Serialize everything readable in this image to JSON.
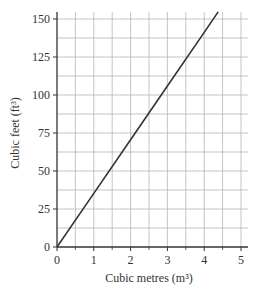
{
  "chart_data": {
    "type": "line",
    "title": "",
    "xlabel": "Cubic metres (m³)",
    "ylabel": "Cubic feet (ft³)",
    "xlim": [
      0,
      5
    ],
    "ylim": [
      0,
      150
    ],
    "x_ticks": [
      0,
      1,
      2,
      3,
      4,
      5
    ],
    "y_ticks": [
      0,
      25,
      50,
      75,
      100,
      125,
      150
    ],
    "x_tick_labels": [
      "0",
      "1",
      "2",
      "3",
      "4",
      "5"
    ],
    "y_tick_labels": [
      "0",
      "25",
      "50",
      "75",
      "100",
      "125",
      "150"
    ],
    "grid": true,
    "x_minor_step": 0.5,
    "y_minor_step": 12.5,
    "legend": null,
    "series": [
      {
        "name": "Conversion line",
        "x": [
          0,
          1,
          2,
          3,
          4,
          4.38
        ],
        "y": [
          0,
          35.3,
          70.6,
          105.9,
          141.2,
          154.7
        ],
        "color": "#333333"
      }
    ]
  },
  "colors": {
    "grid": "#b5b5b5",
    "axis": "#333333",
    "line": "#333333"
  }
}
